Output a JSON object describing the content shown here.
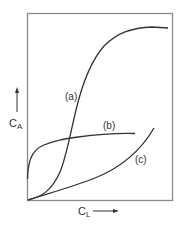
{
  "figure": {
    "y_axis_label": "C",
    "y_axis_subscript": "A",
    "x_axis_label": "C",
    "x_axis_subscript": "L",
    "curves": [
      {
        "id": "a",
        "label": "(a)",
        "shape": "sigmoidal"
      },
      {
        "id": "b",
        "label": "(b)",
        "shape": "rapid rise then plateau"
      },
      {
        "id": "c",
        "label": "(c)",
        "shape": "slow then increasing (convex)"
      }
    ],
    "colors": {
      "line": "#333333",
      "frame": "#8a8a8a",
      "background": "#ffffff"
    }
  }
}
